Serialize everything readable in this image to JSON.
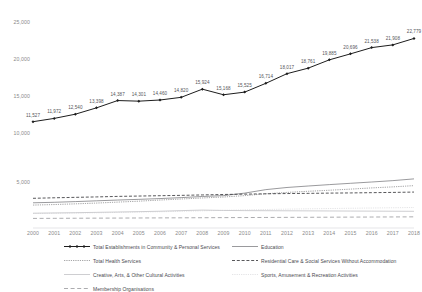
{
  "chart_data": {
    "type": "line",
    "title": "",
    "xlabel": "",
    "ylabel": "",
    "x": [
      2000,
      2001,
      2002,
      2003,
      2004,
      2005,
      2006,
      2007,
      2008,
      2009,
      2010,
      2011,
      2012,
      2013,
      2014,
      2015,
      2016,
      2017,
      2018
    ],
    "panels": [
      {
        "name": "top-panel",
        "ylim": [
          10000,
          25000
        ],
        "yticks": [
          "10,000",
          "15,000",
          "20,000",
          "25,000"
        ],
        "ytick_values": [
          10000,
          15000,
          20000,
          25000
        ],
        "grid": false,
        "series": [
          {
            "name": "Total Establishments in Community & Personal Services",
            "style": "solid-marker",
            "color": "#1d1d1d",
            "values": [
              11527,
              11972,
              12540,
              13398,
              14387,
              14301,
              14460,
              14820,
              15924,
              15168,
              15525,
              16714,
              18017,
              18761,
              19885,
              20696,
              21538,
              21908,
              22779
            ],
            "labels": [
              "11,527",
              "11,972",
              "12,540",
              "13,398",
              "14,387",
              "14,301",
              "14,460",
              "14,820",
              "15,924",
              "15,168",
              "15,525",
              "16,714",
              "18,017",
              "18,761",
              "19,885",
              "20,696",
              "21,538",
              "21,908",
              "22,779"
            ]
          }
        ]
      },
      {
        "name": "bottom-panel",
        "ylim": [
          0,
          7500
        ],
        "yticks": [
          "5,000"
        ],
        "ytick_values": [
          5000
        ],
        "grid": false,
        "series": [
          {
            "name": "Education",
            "style": "solid",
            "color": "#6f6f72",
            "values": [
              2560,
              2620,
              2700,
              2790,
              2880,
              2960,
              3050,
              3160,
              3290,
              3390,
              3680,
              4080,
              4330,
              4500,
              4660,
              4810,
              4960,
              5120,
              5320
            ]
          },
          {
            "name": "Total Health Services",
            "style": "dotted",
            "color": "#4a4a4d",
            "values": [
              2300,
              2360,
              2440,
              2530,
              2640,
              2750,
              2880,
              3000,
              3120,
              3230,
              3390,
              3600,
              3760,
              3890,
              4010,
              4140,
              4280,
              4400,
              4540
            ]
          },
          {
            "name": "Residential Care & Social Services Without Accommodation",
            "style": "dashed",
            "color": "#3a3a3d",
            "values": [
              3080,
              3140,
              3190,
              3240,
              3300,
              3340,
              3380,
              3420,
              3470,
              3520,
              3560,
              3600,
              3630,
              3650,
              3680,
              3700,
              3730,
              3760,
              3800
            ]
          },
          {
            "name": "Creative, Arts, & Other Cultural Activities",
            "style": "solid-light",
            "color": "#b9b9bd",
            "values": [
              1360,
              1390,
              1420,
              1460,
              1500,
              1540,
              1590,
              1660,
              1720,
              1680,
              1660,
              1650,
              1640,
              1630,
              1620,
              1610,
              1600,
              1590,
              1580
            ]
          },
          {
            "name": "Sports, Amusement & Recreation Activities",
            "style": "dotted-light",
            "color": "#c9c9cd",
            "values": [
              1330,
              1350,
              1380,
              1410,
              1450,
              1490,
              1530,
              1580,
              1640,
              1690,
              1740,
              1790,
              1830,
              1870,
              1900,
              1930,
              1960,
              1990,
              2020
            ]
          },
          {
            "name": "Membership Organisations",
            "style": "dashdash",
            "color": "#9d9da1",
            "values": [
              760,
              770,
              780,
              790,
              800,
              810,
              820,
              830,
              840,
              850,
              860,
              870,
              880,
              890,
              900,
              910,
              920,
              930,
              940
            ]
          }
        ]
      }
    ],
    "legend": {
      "position": "bottom",
      "entries": [
        {
          "label": "Total Establishments in Community & Personal Services",
          "style": "solid-marker",
          "color": "#1d1d1d"
        },
        {
          "label": "Education",
          "style": "solid",
          "color": "#6f6f72"
        },
        {
          "label": "Total Health Services",
          "style": "dotted",
          "color": "#4a4a4d"
        },
        {
          "label": "Residential Care & Social Services Without Accommodation",
          "style": "dashed",
          "color": "#3a3a3d"
        },
        {
          "label": "Creative, Arts, & Other Cultural Activities",
          "style": "solid-light",
          "color": "#b9b9bd"
        },
        {
          "label": "Sports, Amusement & Recreation Activities",
          "style": "dotted-light",
          "color": "#c9c9cd"
        },
        {
          "label": "Membership Organisations",
          "style": "dashdash",
          "color": "#9d9da1"
        }
      ]
    }
  },
  "axis": {
    "x_tick_labels": [
      "2000",
      "2001",
      "2002",
      "2003",
      "2004",
      "2005",
      "2006",
      "2007",
      "2008",
      "2009",
      "2010",
      "2011",
      "2012",
      "2013",
      "2014",
      "2015",
      "2016",
      "2017",
      "2018"
    ]
  }
}
